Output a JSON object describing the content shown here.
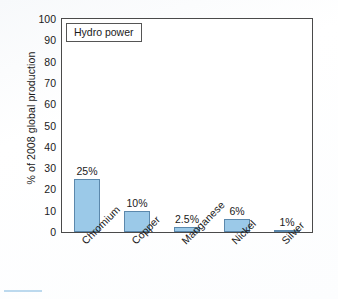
{
  "chart_data": {
    "type": "bar",
    "title": "",
    "legend_label": "Hydro power",
    "legend_position": "inside-top-left",
    "xlabel": "",
    "ylabel": "% of 2008 global production",
    "ylim": [
      0,
      100
    ],
    "y_ticks": [
      0,
      10,
      20,
      30,
      40,
      50,
      60,
      70,
      80,
      90,
      100
    ],
    "grid": false,
    "categories": [
      "Chromium",
      "Copper",
      "Manganese",
      "Nickel",
      "Silver"
    ],
    "values": [
      25,
      10,
      2.5,
      6,
      1
    ],
    "value_labels": [
      "25%",
      "10%",
      "2.5%",
      "6%",
      "1%"
    ],
    "bar_fill_color": "#9bc9e8",
    "bar_border_color": "#5b88ac",
    "axis_color": "#4a4a4a",
    "plot_background": "#ffffff",
    "page_background": "#fdfdfd"
  }
}
